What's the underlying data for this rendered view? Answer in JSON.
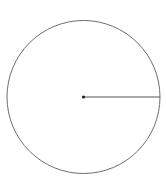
{
  "diagram": {
    "type": "circle-with-radius",
    "canvas": {
      "width": 166,
      "height": 190,
      "background": "#ffffff"
    },
    "circle": {
      "cx": 83.5,
      "cy": 97,
      "r": 76.5,
      "stroke": "#6e6e6e",
      "stroke_width": 1
    },
    "center_point": {
      "cx": 83.5,
      "cy": 97,
      "r": 1.6,
      "fill": "#222222"
    },
    "radius_line": {
      "x1": 83.5,
      "y1": 97,
      "x2": 160,
      "y2": 97,
      "stroke": "#555555",
      "stroke_width": 1
    }
  }
}
